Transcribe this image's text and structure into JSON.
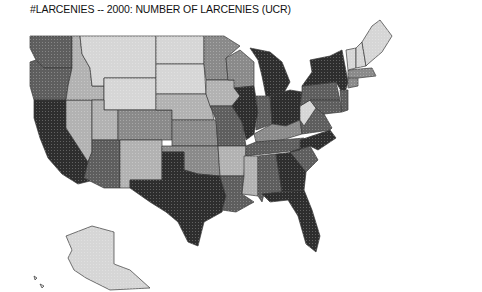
{
  "title": "#LARCENIES -- 2000: NUMBER OF LARCENIES (UCR)",
  "chart_data": {
    "type": "choropleth",
    "title": "#LARCENIES -- 2000: NUMBER OF LARCENIES (UCR)",
    "legend": "none shown",
    "shade_levels": {
      "1": "#d6d6d6",
      "2": "#b2b2b2",
      "3": "#8a8a8a",
      "4": "#5e5e5e",
      "5": "#2e2e2e"
    },
    "states": {
      "WA": 4,
      "OR": 4,
      "CA": 5,
      "NV": 2,
      "ID": 2,
      "MT": 1,
      "WY": 1,
      "UT": 2,
      "AZ": 4,
      "CO": 3,
      "NM": 2,
      "ND": 1,
      "SD": 1,
      "NE": 2,
      "KS": 3,
      "OK": 3,
      "TX": 5,
      "MN": 3,
      "IA": 2,
      "MO": 4,
      "AR": 2,
      "LA": 4,
      "WI": 3,
      "IL": 5,
      "MI": 5,
      "IN": 4,
      "OH": 5,
      "KY": 3,
      "TN": 4,
      "MS": 2,
      "AL": 4,
      "GA": 5,
      "FL": 5,
      "SC": 4,
      "NC": 5,
      "VA": 4,
      "WV": 1,
      "PA": 4,
      "NY": 5,
      "MD": 4,
      "NJ": 4,
      "CT": 3,
      "MA": 3,
      "VT": 1,
      "NH": 1,
      "ME": 1,
      "AK": 1,
      "HI": 1
    }
  }
}
